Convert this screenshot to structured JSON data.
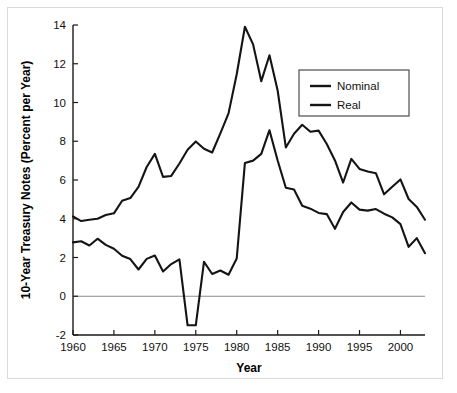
{
  "chart_data": {
    "type": "line",
    "title": "",
    "xlabel": "Year",
    "ylabel": "10-Year Treasury Notes (Percent per Year)",
    "xlim": [
      1960,
      2003
    ],
    "ylim": [
      -2,
      14
    ],
    "xticks": [
      1960,
      1965,
      1970,
      1975,
      1980,
      1985,
      1990,
      1995,
      2000
    ],
    "yticks": [
      -2,
      0,
      2,
      4,
      6,
      8,
      10,
      12,
      14
    ],
    "xtick_labels": [
      "1960",
      "1965",
      "1970",
      "1975",
      "1980",
      "1985",
      "1990",
      "1995",
      "2000"
    ],
    "ytick_labels": [
      "-2",
      "0",
      "2",
      "4",
      "6",
      "8",
      "10",
      "12",
      "14"
    ],
    "grid": false,
    "zero_line": true,
    "legend_position": "top-right",
    "legend_entries": [
      "Nominal",
      "Real"
    ],
    "x": [
      1960,
      1961,
      1962,
      1963,
      1964,
      1965,
      1966,
      1967,
      1968,
      1969,
      1970,
      1971,
      1972,
      1973,
      1974,
      1975,
      1976,
      1977,
      1978,
      1979,
      1980,
      1981,
      1982,
      1983,
      1984,
      1985,
      1986,
      1987,
      1988,
      1989,
      1990,
      1991,
      1992,
      1993,
      1994,
      1995,
      1996,
      1997,
      1998,
      1999,
      2000,
      2001,
      2002,
      2003
    ],
    "series": [
      {
        "name": "Nominal",
        "color": "#141414",
        "values": [
          4.12,
          3.88,
          3.95,
          4.0,
          4.19,
          4.28,
          4.93,
          5.07,
          5.65,
          6.67,
          7.35,
          6.16,
          6.21,
          6.85,
          7.56,
          7.99,
          7.61,
          7.42,
          8.41,
          9.44,
          11.46,
          13.91,
          13.0,
          11.1,
          12.44,
          10.62,
          7.68,
          8.39,
          8.85,
          8.49,
          8.55,
          7.86,
          7.01,
          5.87,
          7.09,
          6.57,
          6.44,
          6.35,
          5.26,
          5.65,
          6.03,
          5.02,
          4.61,
          3.95
        ]
      },
      {
        "name": "Real",
        "color": "#141414",
        "values": [
          2.78,
          2.84,
          2.62,
          2.97,
          2.65,
          2.45,
          2.09,
          1.92,
          1.38,
          1.93,
          2.1,
          1.28,
          1.66,
          1.9,
          -1.5,
          -1.5,
          1.78,
          1.15,
          1.33,
          1.11,
          1.95,
          6.88,
          7.0,
          7.35,
          8.57,
          7.01,
          5.6,
          5.51,
          4.67,
          4.52,
          4.3,
          4.24,
          3.48,
          4.35,
          4.84,
          4.47,
          4.42,
          4.5,
          4.26,
          4.07,
          3.72,
          2.55,
          3.0,
          2.22
        ]
      }
    ]
  }
}
